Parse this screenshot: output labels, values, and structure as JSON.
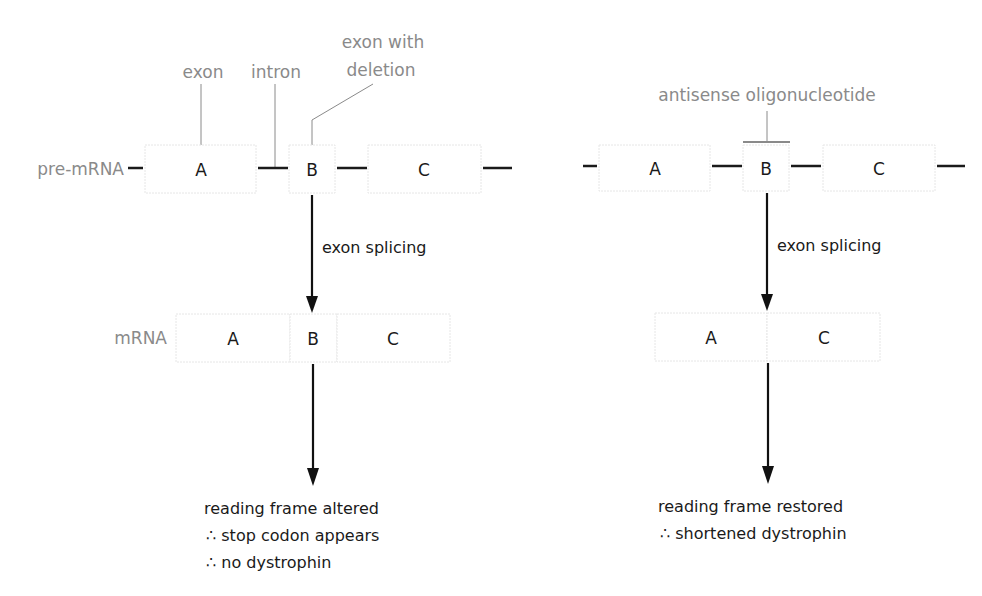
{
  "left_panel": {
    "labels": {
      "exon": "exon",
      "intron": "intron",
      "exon_with_deletion_line1": "exon with",
      "exon_with_deletion_line2": "deletion",
      "pre_mrna": "pre-mRNA",
      "mrna": "mRNA"
    },
    "pre_mrna_exons": [
      "A",
      "B",
      "C"
    ],
    "mrna_exons": [
      "A",
      "B",
      "C"
    ],
    "process_label": "exon splicing",
    "outcome": [
      "reading frame altered",
      "∴ stop codon appears",
      "∴ no dystrophin"
    ]
  },
  "right_panel": {
    "labels": {
      "antisense": "antisense oligonucleotide"
    },
    "pre_mrna_exons": [
      "A",
      "B",
      "C"
    ],
    "mrna_exons": [
      "A",
      "C"
    ],
    "process_label": "exon splicing",
    "outcome": [
      "reading frame restored",
      "∴ shortened dystrophin"
    ]
  },
  "colors": {
    "label_gray": "#8a8a8a",
    "text_black": "#1a1a1a",
    "box_border": "#e6e6e6"
  }
}
